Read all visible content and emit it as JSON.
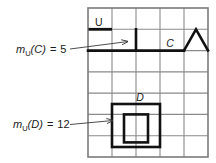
{
  "figure": {
    "type": "grid-diagram",
    "background": "#ffffff",
    "grid": {
      "columns": 5,
      "rows": 7,
      "x": 88,
      "y": 8,
      "width": 120,
      "height": 149,
      "cell_width": 24,
      "cell_height": 21.29,
      "line_color": "#8a8a8a",
      "line_width": 1.1,
      "border_color": "#7a7a7a",
      "border_width": 1.4
    },
    "stroke_color": "#111111",
    "bold_stroke_width": 2.6,
    "annotations": {
      "universe_label": "U",
      "curve_c_label": "C",
      "curve_d_label": "D"
    },
    "measures": [
      {
        "name": "measure-c",
        "prefix": "m",
        "subscript": "U",
        "argument": "(C)",
        "equals": "=",
        "value": "5",
        "text": "mᴜ(C) = 5",
        "x": 16,
        "y": 53,
        "arrow": {
          "x1": 70,
          "y1": 48,
          "x2": 127,
          "y2": 41
        }
      },
      {
        "name": "measure-d",
        "prefix": "m",
        "subscript": "U",
        "argument": "(D)",
        "equals": "=",
        "value": "12",
        "text": "mᴜ(D) = 12",
        "x": 13,
        "y": 127,
        "arrow": {
          "x1": 70,
          "y1": 124,
          "x2": 112,
          "y2": 121
        }
      }
    ],
    "shapes": {
      "u_underline": {
        "x1": 89,
        "y1": 30,
        "x2": 112,
        "y2": 30
      },
      "curve_c_path": "M 88,51 L 136,51 L 136,30 L 112,30 L 112,30",
      "curve_c_points": "M 88,30 L 112,30 M 136,30 L 136,51 L 184,51 L 196,30 L 208,51",
      "curve_d_outer": {
        "x": 112,
        "y": 104,
        "width": 48,
        "height": 43
      },
      "curve_d_inner": {
        "x": 124,
        "y": 114,
        "width": 24,
        "height": 28
      },
      "triangle_apex": {
        "x": 196,
        "y": 30
      }
    }
  }
}
